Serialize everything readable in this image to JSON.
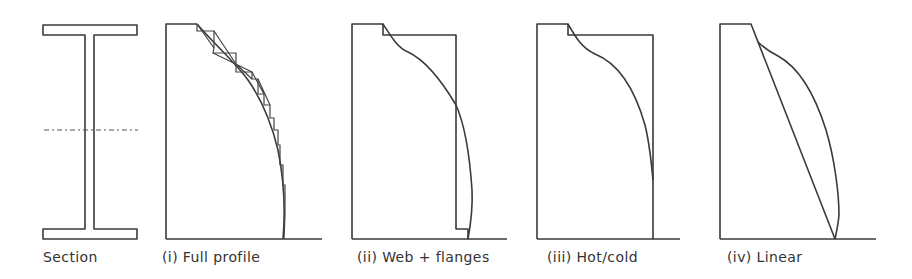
{
  "figure": {
    "panels": [
      {
        "id": "section",
        "label": "Section"
      },
      {
        "id": "full-profile",
        "label": "(i) Full profile"
      },
      {
        "id": "web-flanges",
        "label": "(ii) Web + flanges"
      },
      {
        "id": "hot-cold",
        "label": "(iii) Hot/cold"
      },
      {
        "id": "linear",
        "label": "(iv) Linear"
      }
    ],
    "colors": {
      "line": "#3a3a3a",
      "background": "#ffffff",
      "text": "#333333"
    }
  }
}
